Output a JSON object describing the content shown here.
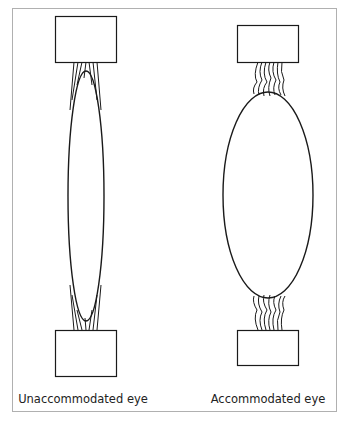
{
  "diagram": {
    "panels": [
      {
        "id": "unaccommodated",
        "label": "Unaccommodated eye",
        "lens_shape": "thin-elongated",
        "zonules": "taut, straight fibers"
      },
      {
        "id": "accommodated",
        "label": "Accommodated eye",
        "lens_shape": "rounded-ellipse",
        "zonules": "relaxed, wavy fibers"
      }
    ],
    "colors": {
      "stroke": "#1a1a1a",
      "frame": "#b0b0b0",
      "background": "#ffffff"
    }
  }
}
